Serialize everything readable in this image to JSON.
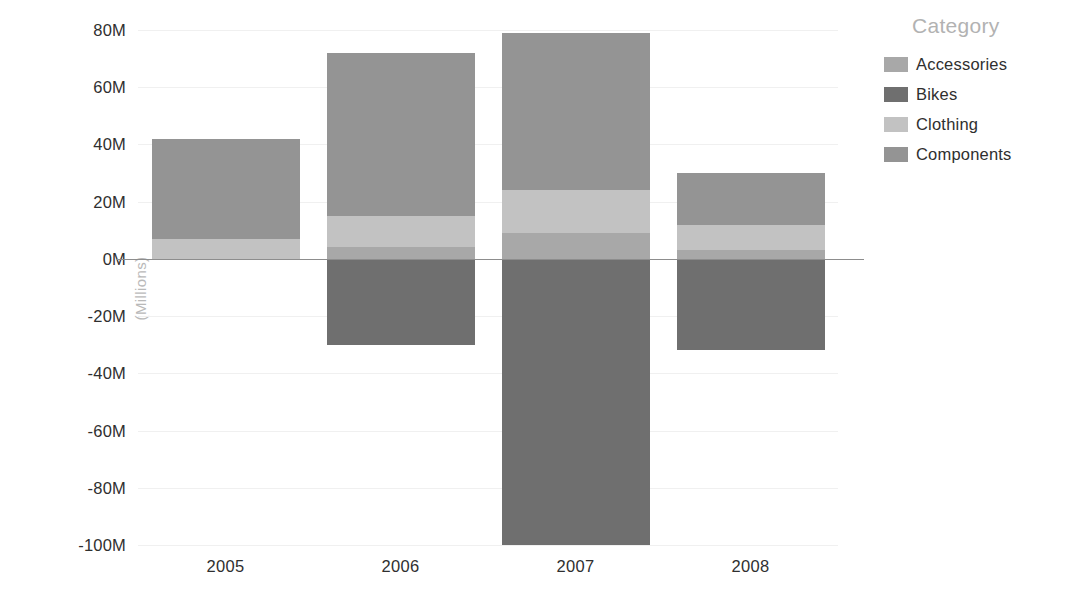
{
  "chart_data": {
    "type": "bar",
    "subtype": "stacked-bar-diverging",
    "title": "",
    "xlabel": "",
    "ylabel": "(Millions)",
    "categories": [
      "2005",
      "2006",
      "2007",
      "2008"
    ],
    "ylim": [
      -100,
      80
    ],
    "ytick_values": [
      80,
      60,
      40,
      20,
      0,
      -20,
      -40,
      -60,
      -80,
      -100
    ],
    "ytick_labels": [
      "80M",
      "60M",
      "40M",
      "20M",
      "0M",
      "-20M",
      "-40M",
      "-60M",
      "-80M",
      "-100M"
    ],
    "grid": true,
    "legend_position": "right",
    "legend_title": "Category",
    "series": [
      {
        "name": "Accessories",
        "color": "#a8a8a8",
        "values": [
          0,
          4,
          9,
          3
        ]
      },
      {
        "name": "Bikes",
        "color": "#6f6f6f",
        "values": [
          0,
          -30,
          -100,
          -32
        ]
      },
      {
        "name": "Clothing",
        "color": "#c2c2c2",
        "values": [
          7,
          11,
          15,
          9
        ]
      },
      {
        "name": "Components",
        "color": "#949494",
        "values": [
          35,
          57,
          55,
          18
        ]
      }
    ],
    "bar_totals_positive": [
      42,
      72,
      79,
      30
    ],
    "bar_totals_negative": [
      0,
      -30,
      -100,
      -32
    ],
    "annotations": []
  },
  "legend": {
    "title": "Category",
    "items": [
      {
        "label": "Accessories",
        "color": "#a8a8a8"
      },
      {
        "label": "Bikes",
        "color": "#6f6f6f"
      },
      {
        "label": "Clothing",
        "color": "#c2c2c2"
      },
      {
        "label": "Components",
        "color": "#949494"
      }
    ]
  },
  "axes": {
    "y_title": "(Millions)"
  },
  "colors": {
    "background": "#ffffff",
    "gridline": "#f0f0f0",
    "zero_line": "#8d8d8d",
    "tick_text": "#2f2f2f",
    "legend_title_text": "#b2b2b2",
    "axis_title_text": "#b9b9b9"
  }
}
